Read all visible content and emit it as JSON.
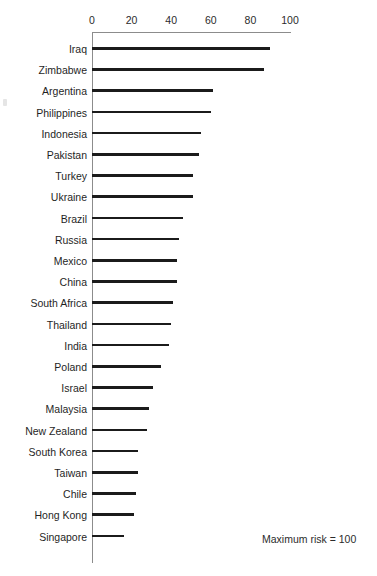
{
  "chart_data": {
    "type": "bar",
    "orientation": "horizontal",
    "title": "",
    "subtitle": "",
    "xlabel": "",
    "ylabel": "",
    "xlim": [
      0,
      100
    ],
    "xticks": [
      0,
      20,
      40,
      60,
      80,
      100
    ],
    "xtick_labels": [
      "0",
      "20",
      "40",
      "60",
      "80",
      "100"
    ],
    "grid": false,
    "legend": null,
    "annotations": [
      "Maximum risk = 100"
    ],
    "categories": [
      "Iraq",
      "Zimbabwe",
      "Argentina",
      "Philippines",
      "Indonesia",
      "Pakistan",
      "Turkey",
      "Ukraine",
      "Brazil",
      "Russia",
      "Mexico",
      "China",
      "South Africa",
      "Thailand",
      "India",
      "Poland",
      "Israel",
      "Malaysia",
      "New Zealand",
      "South Korea",
      "Taiwan",
      "Chile",
      "Hong Kong",
      "Singapore"
    ],
    "values": [
      90,
      87,
      61,
      60,
      55,
      54,
      51,
      51,
      46,
      44,
      43,
      43,
      41,
      40,
      39,
      35,
      31,
      29,
      28,
      23,
      23,
      22,
      21,
      16
    ],
    "bar_color": "#1b1b1b",
    "axis_color": "#8c8c8c"
  },
  "axis": {
    "ticks": [
      {
        "label": "0",
        "value": 0
      },
      {
        "label": "20",
        "value": 20
      },
      {
        "label": "40",
        "value": 40
      },
      {
        "label": "60",
        "value": 60
      },
      {
        "label": "80",
        "value": 80
      },
      {
        "label": "100",
        "value": 100
      }
    ]
  },
  "note": {
    "max_risk": "Maximum risk = 100"
  }
}
